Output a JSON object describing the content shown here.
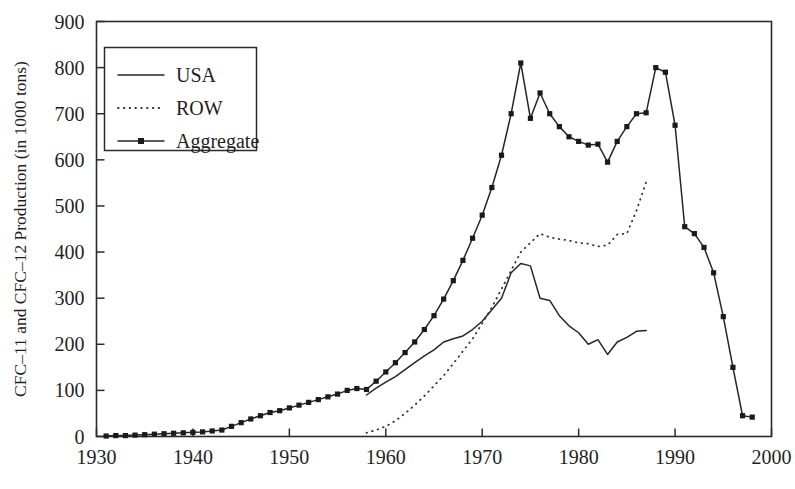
{
  "figure": {
    "ylabel": "CFC–11 and CFC–12 Production (in 1000 tons)",
    "xlabel": "",
    "title": ""
  },
  "legend": {
    "position": "top-left",
    "entries": [
      {
        "label": "USA",
        "style": "solid",
        "marker": "none"
      },
      {
        "label": "ROW",
        "style": "dotted",
        "marker": "none"
      },
      {
        "label": "Aggregate",
        "style": "solid",
        "marker": "filled-square"
      }
    ]
  },
  "axes": {
    "x_ticks": [
      "1930",
      "1940",
      "1950",
      "1960",
      "1970",
      "1980",
      "1990",
      "2000"
    ],
    "y_ticks": [
      "0",
      "100",
      "200",
      "300",
      "400",
      "500",
      "600",
      "700",
      "800",
      "900"
    ],
    "xlim": [
      1930,
      2000
    ],
    "ylim": [
      0,
      900
    ],
    "grid": false
  },
  "chart_data": {
    "type": "line",
    "title": "",
    "xlabel": "",
    "ylabel": "CFC–11 and CFC–12 Production (in 1000 tons)",
    "xlim": [
      1930,
      2000
    ],
    "ylim": [
      0,
      900
    ],
    "grid": false,
    "legend_position": "top-left",
    "series": [
      {
        "name": "Aggregate",
        "style": "solid",
        "marker": "filled-square",
        "x": [
          1931,
          1932,
          1933,
          1934,
          1935,
          1936,
          1937,
          1938,
          1939,
          1940,
          1941,
          1942,
          1943,
          1944,
          1945,
          1946,
          1947,
          1948,
          1949,
          1950,
          1951,
          1952,
          1953,
          1954,
          1955,
          1956,
          1957,
          1958,
          1959,
          1960,
          1961,
          1962,
          1963,
          1964,
          1965,
          1966,
          1967,
          1968,
          1969,
          1970,
          1971,
          1972,
          1973,
          1974,
          1975,
          1976,
          1977,
          1978,
          1979,
          1980,
          1981,
          1982,
          1983,
          1984,
          1985,
          1986,
          1987,
          1988,
          1989,
          1990,
          1991,
          1992,
          1993,
          1994,
          1995,
          1996,
          1997,
          1998
        ],
        "y": [
          1,
          2,
          2,
          3,
          4,
          5,
          6,
          7,
          8,
          9,
          10,
          12,
          14,
          22,
          30,
          38,
          45,
          52,
          56,
          62,
          68,
          74,
          80,
          86,
          92,
          100,
          104,
          102,
          120,
          140,
          160,
          182,
          205,
          232,
          262,
          298,
          338,
          382,
          430,
          480,
          540,
          610,
          700,
          810,
          690,
          745,
          700,
          672,
          650,
          640,
          632,
          634,
          595,
          640,
          672,
          700,
          702,
          800,
          790,
          675,
          455,
          440,
          410,
          355,
          260,
          150,
          45,
          42
        ]
      },
      {
        "name": "USA",
        "style": "solid",
        "marker": "none",
        "x": [
          1958,
          1959,
          1960,
          1961,
          1962,
          1963,
          1964,
          1965,
          1966,
          1967,
          1968,
          1969,
          1970,
          1971,
          1972,
          1973,
          1974,
          1975,
          1976,
          1977,
          1978,
          1979,
          1980,
          1981,
          1982,
          1983,
          1984,
          1985,
          1986,
          1987
        ],
        "y": [
          90,
          105,
          118,
          130,
          145,
          160,
          175,
          188,
          205,
          212,
          218,
          232,
          250,
          275,
          300,
          355,
          375,
          370,
          300,
          295,
          262,
          240,
          225,
          200,
          210,
          178,
          205,
          215,
          228,
          230
        ]
      },
      {
        "name": "ROW",
        "style": "dotted",
        "marker": "none",
        "x": [
          1958,
          1959,
          1960,
          1961,
          1962,
          1963,
          1964,
          1965,
          1966,
          1967,
          1968,
          1969,
          1970,
          1971,
          1972,
          1973,
          1974,
          1975,
          1976,
          1977,
          1978,
          1979,
          1980,
          1981,
          1982,
          1983,
          1984,
          1985,
          1986,
          1987
        ],
        "y": [
          8,
          14,
          22,
          34,
          50,
          68,
          88,
          110,
          132,
          158,
          185,
          212,
          245,
          280,
          320,
          360,
          400,
          420,
          440,
          432,
          428,
          425,
          420,
          418,
          412,
          415,
          438,
          440,
          490,
          552
        ]
      }
    ]
  }
}
